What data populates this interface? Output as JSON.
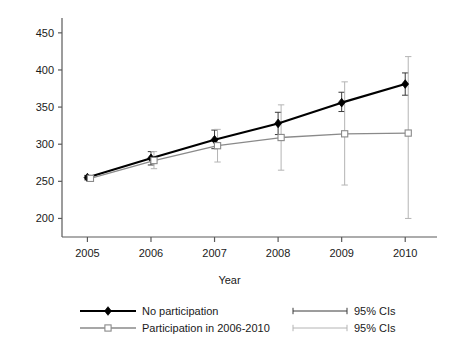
{
  "chart_data": {
    "type": "line",
    "title": "",
    "xlabel": "Year",
    "ylabel": "",
    "x": [
      2005,
      2006,
      2007,
      2008,
      2009,
      2010
    ],
    "categories": [
      "2005",
      "2006",
      "2007",
      "2008",
      "2009",
      "2010"
    ],
    "xlim": [
      2004.6,
      2010.5
    ],
    "ylim": [
      175,
      470
    ],
    "yticks": [
      200,
      250,
      300,
      350,
      400,
      450
    ],
    "ytick_labels": [
      "200",
      "250",
      "300",
      "350",
      "400",
      "450"
    ],
    "xticks": [
      2005,
      2006,
      2007,
      2008,
      2009,
      2010
    ],
    "xtick_labels": [
      "2005",
      "2006",
      "2007",
      "2008",
      "2009",
      "2010"
    ],
    "grid": false,
    "legend_position": "below",
    "series": [
      {
        "name": "No participation",
        "color": "#000000",
        "marker": "filled-diamond",
        "values": [
          255,
          281,
          306,
          328,
          356,
          381
        ],
        "ci_low": [
          252,
          272,
          294,
          313,
          344,
          366
        ],
        "ci_high": [
          258,
          290,
          319,
          343,
          370,
          396
        ],
        "ci_name": "95% CIs",
        "ci_color": "#3a3a3a"
      },
      {
        "name": "Participation in 2006-2010",
        "color": "#8a8a8a",
        "marker": "open-square",
        "values": [
          254,
          278,
          298,
          309,
          314,
          315
        ],
        "ci_low": [
          251,
          267,
          276,
          265,
          245,
          200
        ],
        "ci_high": [
          257,
          290,
          320,
          353,
          384,
          418
        ],
        "ci_name": "95% CIs",
        "ci_color": "#b4b4b4"
      }
    ],
    "annotations": []
  },
  "axis": {
    "x_title": "Year"
  },
  "legend": {
    "entries": [
      {
        "label": "No participation",
        "kind": "series",
        "series_index": 0
      },
      {
        "label": "95% CIs",
        "kind": "ci",
        "series_index": 0
      },
      {
        "label": "Participation in 2006-2010",
        "kind": "series",
        "series_index": 1
      },
      {
        "label": "95% CIs",
        "kind": "ci",
        "series_index": 1
      }
    ]
  },
  "colors": {
    "series_a": "#000000",
    "series_b": "#8a8a8a",
    "ci_a": "#3a3a3a",
    "ci_b": "#b4b4b4",
    "axis": "#5a5a5a",
    "text": "#1a1a1a",
    "background": "#ffffff"
  }
}
